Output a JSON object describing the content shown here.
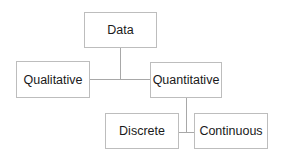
{
  "diagram": {
    "type": "tree",
    "nodes": {
      "root": {
        "label": "Data"
      },
      "qualitative": {
        "label": "Qualitative"
      },
      "quantitative": {
        "label": "Quantitative"
      },
      "discrete": {
        "label": "Discrete"
      },
      "continuous": {
        "label": "Continuous"
      }
    },
    "edges": [
      {
        "from": "Data",
        "to": "Qualitative"
      },
      {
        "from": "Data",
        "to": "Quantitative"
      },
      {
        "from": "Quantitative",
        "to": "Discrete"
      },
      {
        "from": "Quantitative",
        "to": "Continuous"
      }
    ],
    "colors": {
      "border": "#bdbdbd",
      "connector": "#a8a8a8",
      "text": "#1a1a1a",
      "background": "#ffffff"
    }
  }
}
